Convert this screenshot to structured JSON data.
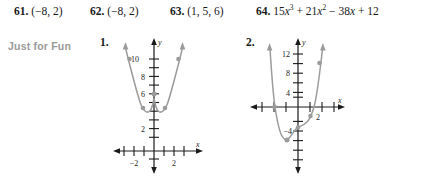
{
  "answers": [
    {
      "number": "61.",
      "text": "(−8, 2)",
      "left": 14
    },
    {
      "number": "62.",
      "text": "(−8, 2)",
      "left": 90
    },
    {
      "number": "63.",
      "text": "(1, 5, 6)",
      "left": 170
    },
    {
      "number": "64.",
      "text": "15x³ + 21x² − 38x + 12",
      "left": 256,
      "parts": [
        {
          "t": "15",
          "i": false
        },
        {
          "t": "x",
          "i": true
        },
        {
          "t": "3",
          "sup": true
        },
        {
          "t": " + 21",
          "i": false
        },
        {
          "t": "x",
          "i": true
        },
        {
          "t": "2",
          "sup": true
        },
        {
          "t": " − 38",
          "i": false
        },
        {
          "t": "x",
          "i": true
        },
        {
          "t": " + 12",
          "i": false
        }
      ]
    }
  ],
  "section": {
    "label": "Just for Fun",
    "label_color": "#9a9a9a"
  },
  "figures": [
    {
      "number": "1.",
      "curve_color": "#9b9b9b",
      "axis_color": "#1a1a1a",
      "x_axis_label": "x",
      "y_axis_label": "y",
      "x_ticks": [
        "−2",
        "2"
      ],
      "y_ticks": [
        "10",
        "8",
        "6",
        "2"
      ],
      "chart_data": {
        "type": "line",
        "title": "",
        "xlabel": "x",
        "ylabel": "y",
        "xlim": [
          -3,
          3
        ],
        "ylim": [
          -1,
          13
        ],
        "grid": false,
        "description": "W-shaped quartic with local maximum at (0, 6) and two minima near (±0.7, 4.5); branches rise with arrowheads",
        "x": [
          -1.45,
          -1.3,
          -1.15,
          -1.0,
          -0.85,
          -0.7,
          -0.55,
          -0.4,
          -0.25,
          0,
          0.25,
          0.4,
          0.55,
          0.7,
          0.85,
          1.0,
          1.15,
          1.3,
          1.45
        ],
        "y": [
          12.2,
          10.2,
          8.3,
          6.8,
          5.4,
          4.5,
          4.6,
          5.1,
          5.7,
          6.0,
          5.7,
          5.1,
          4.6,
          4.5,
          5.4,
          6.8,
          8.3,
          10.2,
          12.2
        ]
      }
    },
    {
      "number": "2.",
      "curve_color": "#9b9b9b",
      "axis_color": "#1a1a1a",
      "x_axis_label": "x",
      "y_axis_label": "y",
      "x_ticks": [
        "2"
      ],
      "y_ticks": [
        "12",
        "8",
        "4",
        "−4"
      ],
      "chart_data": {
        "type": "line",
        "title": "",
        "xlabel": "x",
        "ylabel": "y",
        "xlim": [
          -3.2,
          3.2
        ],
        "ylim": [
          -8,
          15
        ],
        "grid": false,
        "description": "Quartic crossing the x-axis near x = −2 and x = 1.3, dipping to a minimum near (−1, −6) with a shallow bend near x = 0; both branches rise with arrowheads",
        "x": [
          -2.25,
          -2.1,
          -2.0,
          -1.8,
          -1.6,
          -1.4,
          -1.2,
          -1.0,
          -0.8,
          -0.6,
          -0.4,
          -0.2,
          0,
          0.3,
          0.6,
          0.9,
          1.1,
          1.3,
          1.5,
          1.7,
          1.9
        ],
        "y": [
          13.5,
          7.0,
          3.2,
          -1.5,
          -4.0,
          -5.4,
          -6.0,
          -6.2,
          -5.8,
          -5.3,
          -4.9,
          -4.6,
          -4.5,
          -4.4,
          -4.0,
          -2.6,
          -1.0,
          1.0,
          4.2,
          8.5,
          13.5
        ]
      }
    }
  ]
}
